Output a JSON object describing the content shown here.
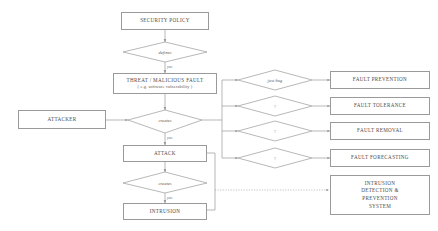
{
  "diagram": {
    "stroke_color": "#9a9a9a",
    "text_color": "#4a4a4a",
    "nodes": {
      "security_policy": {
        "label": "SECURITY POLICY"
      },
      "defines_decision": {
        "label": "defines"
      },
      "threat": {
        "line1": "THREAT / MALICIOUS FAULT",
        "line2": "( e.g. software vulnerability )"
      },
      "attacker": {
        "label": "ATTACKER"
      },
      "creates_decision_1": {
        "label": "creates"
      },
      "attack": {
        "label": "ATTACK"
      },
      "creates_decision_2": {
        "label": "creates"
      },
      "intrusion": {
        "label": "INTRUSION"
      },
      "fault_prevention": {
        "label": "FAULT PREVENTION"
      },
      "fault_tolerance": {
        "label": "FAULT TOLERANCE"
      },
      "fault_removal": {
        "label": "FAULT REMOVAL"
      },
      "fault_forecasting": {
        "label": "FAULT FORECASTING"
      },
      "idps": {
        "line1": "INTRUSION",
        "line2": "DETECTION &",
        "line3": "PREVENTION",
        "line4": "SYSTEM"
      },
      "branch_decision_1": {
        "label": "just bug"
      },
      "branch_decision_2": {
        "label": "?"
      },
      "branch_decision_3": {
        "label": "?"
      },
      "branch_decision_4": {
        "label": "?"
      }
    },
    "edge_labels": {
      "policy_to_defines": "",
      "defines_to_threat": "yes",
      "threat_to_creates": "",
      "creates_to_attack": "yes",
      "attack_to_creates2": "",
      "creates2_to_intrusion": "yes"
    }
  }
}
